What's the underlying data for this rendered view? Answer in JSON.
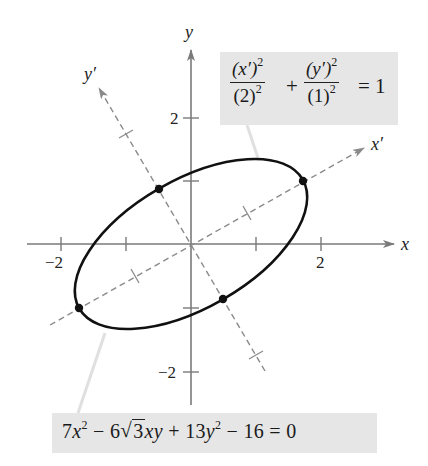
{
  "diagram": {
    "type": "rotated-ellipse",
    "rotation_degrees": 30,
    "center": [
      0,
      0
    ],
    "semi_major": 2,
    "semi_minor": 1,
    "axes": {
      "x_label": "x",
      "y_label": "y",
      "x_prime_label": "x′",
      "y_prime_label": "y′"
    },
    "tick_labels": {
      "x_neg2": "−2",
      "x_pos2": "2",
      "y_pos2": "2",
      "y_neg2": "−2"
    },
    "vertices": [
      {
        "name": "vertex-positive",
        "x": 1.732,
        "y": 1.0
      },
      {
        "name": "vertex-negative",
        "x": -1.732,
        "y": -1.0
      },
      {
        "name": "covertex-positive",
        "x": -0.5,
        "y": 0.866
      },
      {
        "name": "covertex-negative",
        "x": 0.5,
        "y": -0.866
      }
    ],
    "colors": {
      "ellipse": "#111111",
      "axes": "#7a7a7a",
      "rotated_axes": "#8a8a8a",
      "label_box": "#e6e6e6",
      "leader": "#e0e0e0"
    }
  },
  "equations": {
    "standard_form": {
      "term1_num": "(x′)",
      "term1_num_exp": "2",
      "term1_den": "(2)",
      "term1_den_exp": "2",
      "plus": "+",
      "term2_num": "(y′)",
      "term2_num_exp": "2",
      "term2_den": "(1)",
      "term2_den_exp": "2",
      "equals": "= 1"
    },
    "general_form": {
      "a_coef": "7",
      "x_var": "x",
      "exp1": "2",
      "minus1": " − 6",
      "radicand": "3",
      "xy": "xy",
      "plus": " + 13",
      "y_var": "y",
      "exp2": "2",
      "tail": " − 16 = 0"
    }
  }
}
